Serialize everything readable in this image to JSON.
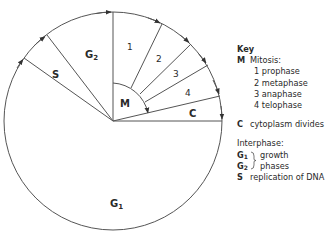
{
  "diagram": {
    "center": {
      "x": 113,
      "y": 121
    },
    "radius": 109,
    "stroke_color": "#555555",
    "segments": [
      {
        "id": "G2",
        "label": "G",
        "sub": "2"
      },
      {
        "id": "S",
        "label": "S"
      },
      {
        "id": "G1",
        "label": "G",
        "sub": "1"
      },
      {
        "id": "M",
        "label": "M"
      },
      {
        "id": "1",
        "label": "1"
      },
      {
        "id": "2",
        "label": "2"
      },
      {
        "id": "3",
        "label": "3"
      },
      {
        "id": "4",
        "label": "4"
      },
      {
        "id": "C",
        "label": "C"
      }
    ]
  },
  "key": {
    "heading": "Key",
    "mitosis": {
      "letter": "M",
      "label": "Mitosis:",
      "phases": [
        "1 prophase",
        "2 metaphase",
        "3 anaphase",
        "4 telophase"
      ]
    },
    "cytokinesis": {
      "letter": "C",
      "label": "cytoplasm divides"
    },
    "interphase": {
      "heading": "Interphase:",
      "g1": {
        "letter": "G",
        "sub": "1"
      },
      "g2": {
        "letter": "G",
        "sub": "2"
      },
      "growth_line1": "growth",
      "growth_line2": "phases",
      "s": {
        "letter": "S",
        "label": "replication of DNA"
      }
    }
  }
}
